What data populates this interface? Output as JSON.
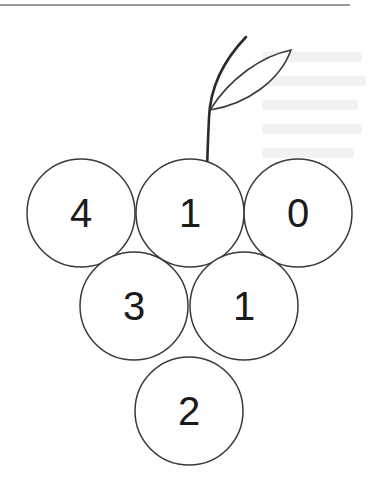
{
  "diagram": {
    "type": "grape-cluster-number-puzzle",
    "grapes": [
      {
        "id": "top-left",
        "value": "4",
        "cx": 81,
        "cy": 213
      },
      {
        "id": "top-center",
        "value": "1",
        "cx": 190,
        "cy": 213
      },
      {
        "id": "top-right",
        "value": "0",
        "cx": 298,
        "cy": 213
      },
      {
        "id": "middle-left",
        "value": "3",
        "cx": 134,
        "cy": 306
      },
      {
        "id": "middle-right",
        "value": "1",
        "cx": 244,
        "cy": 306
      },
      {
        "id": "bottom",
        "value": "2",
        "cx": 189,
        "cy": 411
      }
    ],
    "grape_radius": 54,
    "stroke_color": "#3a3a3a",
    "text_color": "#1a1a1a"
  }
}
